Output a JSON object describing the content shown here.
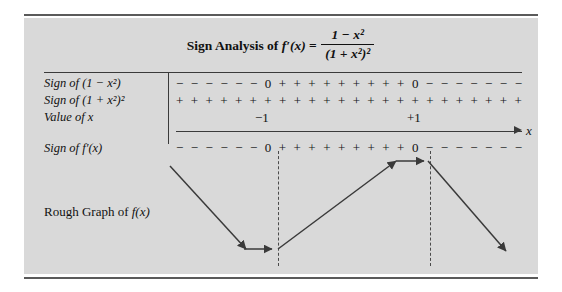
{
  "figure": {
    "title": {
      "prefix": "Sign Analysis of ",
      "function": "f′(x)",
      "equals": " = ",
      "numerator": "1 − x²",
      "denominator": "(1 + x²)²"
    },
    "rows": [
      {
        "name": "sign-of-numerator",
        "label": "Sign of (1 − x²)",
        "signs": [
          "−",
          "−",
          "−",
          "−",
          "−",
          "−",
          "0",
          "+",
          "+",
          "+",
          "+",
          "+",
          "+",
          "+",
          "+",
          "+",
          "0",
          "−",
          "−",
          "−",
          "−",
          "−",
          "−",
          "−"
        ]
      },
      {
        "name": "sign-of-denominator",
        "label": "Sign of (1 + x²)²",
        "signs": [
          "+",
          "+",
          "+",
          "+",
          "+",
          "+",
          "+",
          "+",
          "+",
          "+",
          "+",
          "+",
          "+",
          "+",
          "+",
          "+",
          "+",
          "+",
          "+",
          "+",
          "+",
          "+",
          "+",
          "+"
        ]
      },
      {
        "name": "value-of-x",
        "label": "Value of x",
        "signs": []
      },
      {
        "name": "sign-of-derivative",
        "label": "Sign of f′(x)",
        "signs": [
          "−",
          "−",
          "−",
          "−",
          "−",
          "−",
          "0",
          "+",
          "+",
          "+",
          "+",
          "+",
          "+",
          "+",
          "+",
          "+",
          "0",
          "−",
          "−",
          "−",
          "−",
          "−",
          "−",
          "−"
        ]
      }
    ],
    "critical_values": [
      {
        "name": "x-value-negative-one",
        "label": "−1"
      },
      {
        "name": "x-value-positive-one",
        "label": "+1"
      }
    ],
    "axis": {
      "label": "x"
    },
    "graph": {
      "caption_prefix": "Rough Graph of ",
      "caption_function": "f(x)"
    },
    "colors": {
      "panel_background": "#d9d9d9",
      "page_background": "#ffffff",
      "ink": "#111111",
      "rule": "#3a3a3a",
      "dashed_line": "#4a4a4a"
    }
  }
}
